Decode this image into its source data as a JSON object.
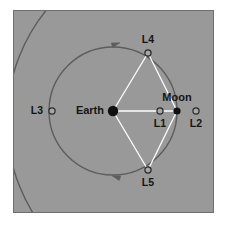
{
  "figure": {
    "canvas": {
      "width": 225,
      "height": 227
    },
    "panel": {
      "x": 13,
      "y": 10,
      "width": 201,
      "height": 203,
      "fill": "#999999",
      "border_color": "#6f6f6f"
    },
    "colors": {
      "background": "#ffffff",
      "panel_fill": "#999999",
      "orbit_stroke": "#5d5d5d",
      "connector_stroke": "#ffffff",
      "body_fill": "#101010",
      "marker_stroke": "#2a2a2a",
      "marker_fill": "#a8a8a8",
      "text": "#151515"
    }
  },
  "orbits": [
    {
      "name": "moon-orbit",
      "shape": "circle",
      "cx": 113,
      "cy": 111,
      "r": 64,
      "stroke": "#5d5d5d",
      "stroke_width": 1.4,
      "description": "Moon's orbit around Earth"
    },
    {
      "name": "outer-arc",
      "shape": "circle",
      "cx": 183,
      "cy": 121,
      "r": 176,
      "stroke": "#5d5d5d",
      "stroke_width": 1.4,
      "description": "Larger co-orbital arc crossing the frame"
    }
  ],
  "direction_arrows": [
    {
      "name": "orbit-arrow-top",
      "x": 116,
      "y": 44,
      "angle": -18
    },
    {
      "name": "orbit-arrow-bottom",
      "x": 116,
      "y": 177,
      "angle": 198
    }
  ],
  "connectors": [
    {
      "name": "earth-moon-line",
      "x1": 113,
      "y1": 111,
      "x2": 177,
      "y2": 111
    },
    {
      "name": "earth-l4-line",
      "x1": 113,
      "y1": 111,
      "x2": 148,
      "y2": 53
    },
    {
      "name": "l4-moon-line",
      "x1": 148,
      "y1": 53,
      "x2": 177,
      "y2": 111
    },
    {
      "name": "earth-l5-line",
      "x1": 113,
      "y1": 111,
      "x2": 148,
      "y2": 170
    },
    {
      "name": "l5-moon-line",
      "x1": 148,
      "y1": 170,
      "x2": 177,
      "y2": 111
    }
  ],
  "bodies": [
    {
      "id": "earth",
      "label": "Earth",
      "type": "filled",
      "x": 113,
      "y": 111,
      "r": 5.2,
      "label_x": 104,
      "label_y": 111,
      "label_anchor": "end",
      "label_size": "normal"
    },
    {
      "id": "moon",
      "label": "Moon",
      "type": "filled",
      "x": 177,
      "y": 111,
      "r": 3.6,
      "label_x": 177,
      "label_y": 98,
      "label_anchor": "middle",
      "label_size": "normal"
    }
  ],
  "lagrange_points": [
    {
      "id": "l1",
      "label": "L1",
      "type": "open",
      "x": 160,
      "y": 111,
      "r": 3.1,
      "label_x": 160,
      "label_y": 124,
      "label_anchor": "middle",
      "label_size": "small"
    },
    {
      "id": "l2",
      "label": "L2",
      "type": "open",
      "x": 196,
      "y": 111,
      "r": 3.1,
      "label_x": 196,
      "label_y": 124,
      "label_anchor": "middle",
      "label_size": "small"
    },
    {
      "id": "l3",
      "label": "L3",
      "type": "open",
      "x": 52,
      "y": 111,
      "r": 3.1,
      "label_x": 43,
      "label_y": 111,
      "label_anchor": "end",
      "label_size": "small"
    },
    {
      "id": "l4",
      "label": "L4",
      "type": "open",
      "x": 148,
      "y": 53,
      "r": 3.1,
      "label_x": 148,
      "label_y": 40,
      "label_anchor": "middle",
      "label_size": "small"
    },
    {
      "id": "l5",
      "label": "L5",
      "type": "open",
      "x": 148,
      "y": 170,
      "r": 3.1,
      "label_x": 148,
      "label_y": 183,
      "label_anchor": "middle",
      "label_size": "small"
    }
  ]
}
